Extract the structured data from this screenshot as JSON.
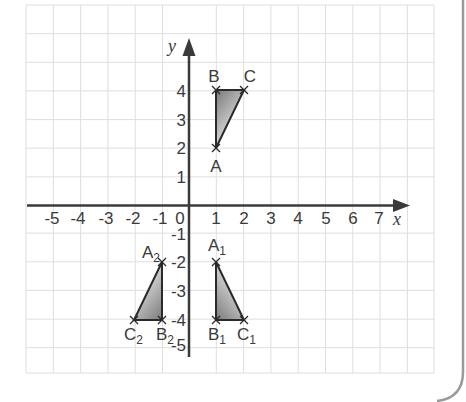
{
  "figure": {
    "type": "coordinate-grid",
    "axes": {
      "x_label": "x",
      "y_label": "y",
      "x_ticks": [
        "-5",
        "-4",
        "-3",
        "-2",
        "-1",
        "0",
        "1",
        "2",
        "3",
        "4",
        "5",
        "6",
        "7"
      ],
      "y_ticks": [
        "4",
        "3",
        "2",
        "1",
        "-1",
        "-2",
        "-3",
        "-4",
        "-5"
      ],
      "origin_label": "0",
      "x_range": [
        -6,
        9
      ],
      "y_range": [
        -6,
        7
      ]
    },
    "triangles": [
      {
        "name": "ABC",
        "vertices": [
          {
            "label": "A",
            "sub": "",
            "x": 1,
            "y": 2
          },
          {
            "label": "B",
            "sub": "",
            "x": 1,
            "y": 4
          },
          {
            "label": "C",
            "sub": "",
            "x": 2,
            "y": 4
          }
        ]
      },
      {
        "name": "A1B1C1",
        "vertices": [
          {
            "label": "A",
            "sub": "1",
            "x": 1,
            "y": -2
          },
          {
            "label": "B",
            "sub": "1",
            "x": 1,
            "y": -4
          },
          {
            "label": "C",
            "sub": "1",
            "x": 2,
            "y": -4
          }
        ]
      },
      {
        "name": "A2B2C2",
        "vertices": [
          {
            "label": "A",
            "sub": "2",
            "x": -1,
            "y": -2
          },
          {
            "label": "B",
            "sub": "2",
            "x": -1,
            "y": -4
          },
          {
            "label": "C",
            "sub": "2",
            "x": -2,
            "y": -4
          }
        ]
      }
    ],
    "colors": {
      "grid": "#dcdcdc",
      "axis": "#3a3a3a",
      "triangle_stroke": "#2a2a2a",
      "fill_dark": "#8a8a8a",
      "fill_light": "#f2f2f2",
      "frame": "#9a9a9a"
    }
  },
  "labels": {
    "A": "A",
    "B": "B",
    "C": "C",
    "A1": "A",
    "A1_sub": "1",
    "B1": "B",
    "B1_sub": "1",
    "C1": "C",
    "C1_sub": "1",
    "A2": "A",
    "A2_sub": "2",
    "B2": "B",
    "B2_sub": "2",
    "C2": "C",
    "C2_sub": "2",
    "x_axis": "x",
    "y_axis": "y",
    "origin": "0",
    "xt_m5": "-5",
    "xt_m4": "-4",
    "xt_m3": "-3",
    "xt_m2": "-2",
    "xt_m1": "-1",
    "xt_1": "1",
    "xt_2": "2",
    "xt_3": "3",
    "xt_4": "4",
    "xt_5": "5",
    "xt_6": "6",
    "xt_7": "7",
    "yt_4": "4",
    "yt_3": "3",
    "yt_2": "2",
    "yt_1": "1",
    "yt_m1": "-1",
    "yt_m2": "-2",
    "yt_m3": "-3",
    "yt_m4": "-4",
    "yt_m5": "-5"
  }
}
